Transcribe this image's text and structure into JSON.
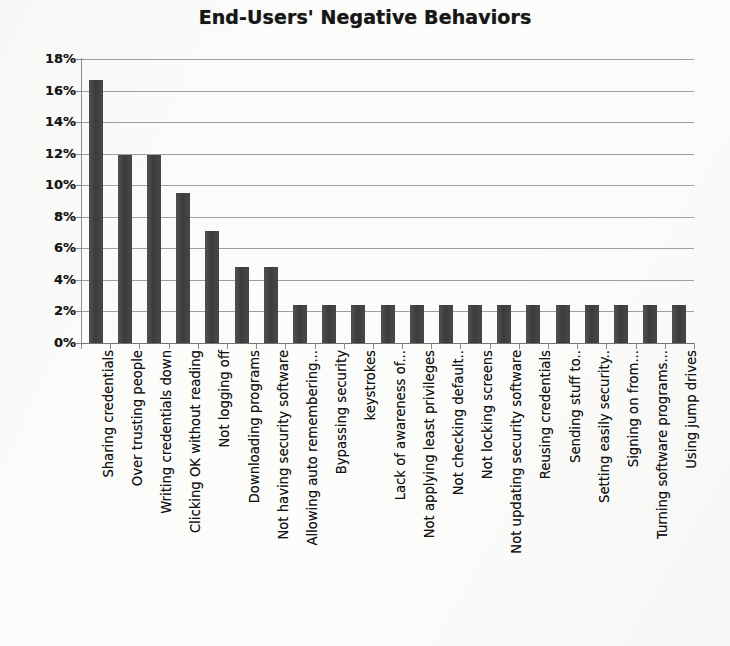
{
  "chart_data": {
    "type": "bar",
    "title": "End-Users' Negative Behaviors",
    "xlabel": "",
    "ylabel": "",
    "ylim": [
      0,
      18
    ],
    "ytick_labels": [
      "18%",
      "16%",
      "14%",
      "12%",
      "10%",
      "8%",
      "6%",
      "4%",
      "2%",
      "0%"
    ],
    "ytick_values": [
      18,
      16,
      14,
      12,
      10,
      8,
      6,
      4,
      2,
      0
    ],
    "grid": true,
    "legend": "none",
    "orientation": "vertical",
    "bar_color": "#3f3f3f",
    "categories": [
      "Sharing credentials",
      "Over trusting people",
      "Writing credentials down",
      "Clicking OK without reading",
      "Not logging off",
      "Downloading programs",
      "Not having security software",
      "Allowing auto remembering...",
      "Bypassing security",
      "keystrokes",
      "Lack of awareness of...",
      "Not applying least privileges",
      "Not checking default..",
      "Not locking screens",
      "Not updating security software",
      "Reusing credentials",
      "Sending stuff to..",
      "Setting easily security..",
      "Signing on from...",
      "Turning software programs...",
      "Using jump drives"
    ],
    "values": [
      16.7,
      11.9,
      11.9,
      9.5,
      7.1,
      4.8,
      4.8,
      2.4,
      2.4,
      2.4,
      2.4,
      2.4,
      2.4,
      2.4,
      2.4,
      2.4,
      2.4,
      2.4,
      2.4,
      2.4,
      2.4
    ]
  },
  "colors": {
    "bar": "#3f3f3f",
    "grid": "#8d8d8d",
    "text": "#121212",
    "background": "#fcfcfa"
  }
}
